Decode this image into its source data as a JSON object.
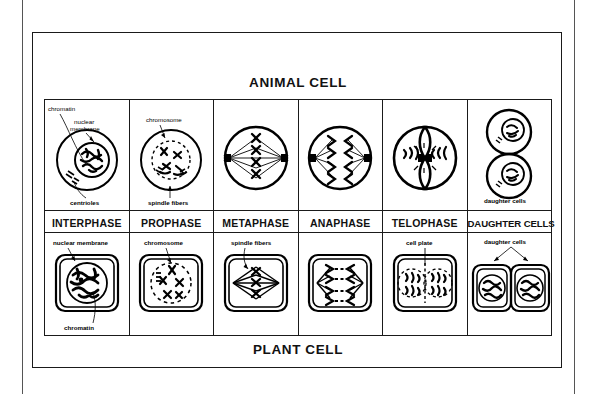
{
  "figure": {
    "top_band_title": "ANIMAL CELL",
    "bottom_band_title": "PLANT CELL"
  },
  "phases": [
    {
      "key": "interphase",
      "label": "INTERPHASE"
    },
    {
      "key": "prophase",
      "label": "PROPHASE"
    },
    {
      "key": "metaphase",
      "label": "METAPHASE"
    },
    {
      "key": "anaphase",
      "label": "ANAPHASE"
    },
    {
      "key": "telophase",
      "label": "TELOPHASE"
    },
    {
      "key": "daughter-cells",
      "label": "DAUGHTER CELLS"
    }
  ],
  "animal_row": {
    "interphase": {
      "callouts": [
        "chromatin",
        "nuclear membrane",
        "centrioles"
      ]
    },
    "prophase": {
      "callouts": [
        "chromosome",
        "spindle fibers"
      ]
    },
    "metaphase": {
      "callouts": []
    },
    "anaphase": {
      "callouts": []
    },
    "telophase": {
      "callouts": []
    },
    "daughter_cells": {
      "callouts": [
        "daughter cells"
      ]
    }
  },
  "plant_row": {
    "interphase": {
      "callouts": [
        "nuclear membrane",
        "chromatin"
      ]
    },
    "prophase": {
      "callouts": [
        "chromosome"
      ]
    },
    "metaphase": {
      "callouts": [
        "spindle fibers"
      ]
    },
    "anaphase": {
      "callouts": []
    },
    "telophase": {
      "callouts": [
        "cell plate"
      ]
    },
    "daughter_cells": {
      "callouts": [
        "daughter cells"
      ]
    }
  },
  "colors": {
    "ink": "#000000",
    "frame": "#1a1a1a",
    "background": "#ffffff"
  }
}
